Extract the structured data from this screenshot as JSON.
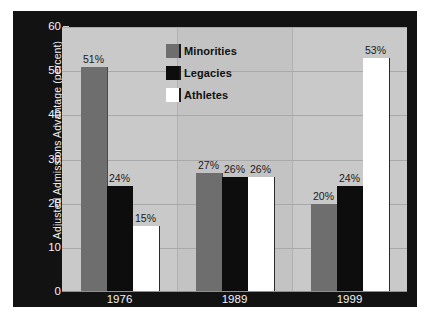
{
  "chart_data": {
    "type": "bar",
    "title": "",
    "xlabel": "",
    "ylabel": "Adjusted Admissions Advantage (percent)",
    "categories": [
      "1976",
      "1989",
      "1999"
    ],
    "series": [
      {
        "name": "Minorities",
        "color": "#6e6e6e",
        "values": [
          51,
          27,
          20
        ],
        "labels": [
          "51%",
          "27%",
          "20%"
        ]
      },
      {
        "name": "Legacies",
        "color": "#0d0d0d",
        "values": [
          24,
          26,
          24
        ],
        "labels": [
          "24%",
          "26%",
          "24%"
        ]
      },
      {
        "name": "Athletes",
        "color": "#ffffff",
        "values": [
          15,
          26,
          53
        ],
        "labels": [
          "15%",
          "26%",
          "53%"
        ]
      }
    ],
    "ylim": [
      0,
      60
    ],
    "yticks": [
      0,
      10,
      20,
      30,
      40,
      50,
      60
    ],
    "ytick_labels": [
      "0",
      "10",
      "20",
      "30",
      "40",
      "50",
      "60"
    ],
    "grid": true,
    "legend_position": "top-center",
    "plot_background": "#c9c9c9",
    "frame_background": "#121212",
    "axis_text_color": "#f4f4f4"
  },
  "axis": {
    "y_title": "Adjusted Admissions Advantage (percent)"
  },
  "legend": {
    "items": [
      {
        "label": "Minorities"
      },
      {
        "label": "Legacies"
      },
      {
        "label": "Athletes"
      }
    ]
  }
}
